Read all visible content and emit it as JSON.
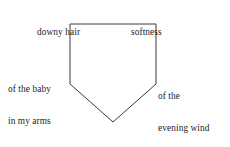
{
  "diagram": {
    "type": "pentagon-poem-diagram",
    "background_color": "#ffffff",
    "stroke_color": "#3a3a3a",
    "text_color": "#1c1c1c",
    "shape": {
      "name": "pentagon",
      "points": "70,24 156,24 156,84 113,122 70,84"
    },
    "labels": {
      "top_left": "downy hair",
      "top_right": "softness",
      "left_line1": "of the baby",
      "left_line2": "in my arms",
      "right_line1": "of the",
      "right_line2": "evening wind",
      "bottom": "I love"
    }
  }
}
